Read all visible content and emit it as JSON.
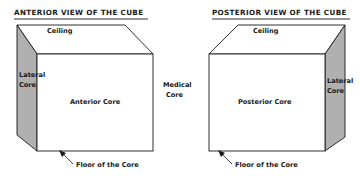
{
  "figure": {
    "background_color": "#ffffff",
    "line_color": "#1a1a1a",
    "shade_color": "#b0b0b0",
    "face_color": "#ffffff",
    "text_color": "#1a1a1a"
  },
  "middle": {
    "label_line1": "Medical",
    "label_line2": "Core"
  },
  "panels": [
    {
      "id": "anterior",
      "title": "ANTERIOR VIEW OF THE CUBE",
      "ceiling_label": "Ceiling",
      "front_label": "Anterior Core",
      "side_label_line1": "Lateral",
      "side_label_line2": "Core",
      "side_position": "left",
      "floor_label": "Floor of the Core"
    },
    {
      "id": "posterior",
      "title": "POSTERIOR VIEW OF THE CUBE",
      "ceiling_label": "Ceiling",
      "front_label": "Posterior Core",
      "side_label_line1": "Lateral",
      "side_label_line2": "Core",
      "side_position": "right",
      "floor_label": "Floor of the Core"
    }
  ]
}
